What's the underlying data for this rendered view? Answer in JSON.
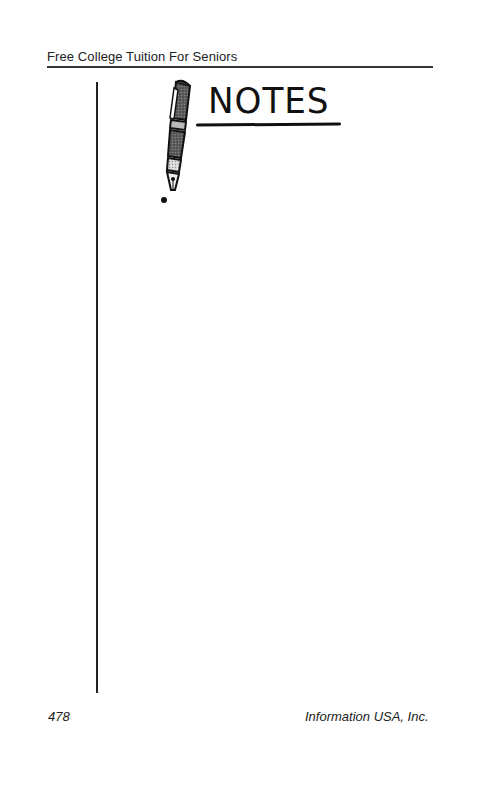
{
  "header": {
    "running_title": "Free College Tuition For Seniors"
  },
  "graphic": {
    "title": "NOTES",
    "icon": "fountain-pen-icon"
  },
  "footer": {
    "page_number": "478",
    "publisher": "Information USA, Inc."
  }
}
